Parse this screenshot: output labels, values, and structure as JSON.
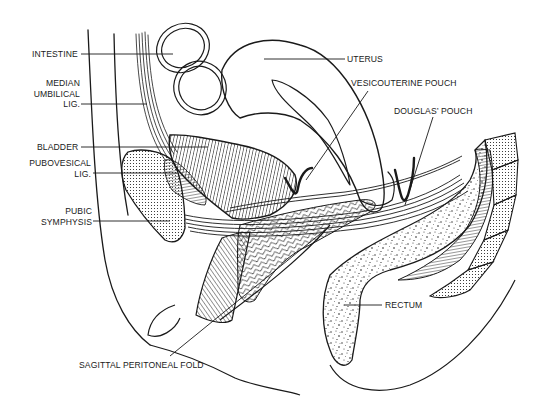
{
  "diagram": {
    "type": "anatomical-sagittal-section",
    "colors": {
      "ink": "#1a1a1a",
      "background": "#ffffff"
    },
    "labels": {
      "intestine": "INTESTINE",
      "median_umbilical_lig": "MEDIAN\nUMBILICAL\nLIG.",
      "bladder": "BLADDER",
      "pubovesical_lig": "PUBOVESICAL\nLIG.",
      "pubic_symphysis": "PUBIC\nSYMPHYSIS",
      "uterus": "UTERUS",
      "vesicouterine_pouch": "VESICOUTERINE POUCH",
      "douglas_pouch": "DOUGLAS’ POUCH",
      "rectum": "RECTUM",
      "sagittal_peritoneal_fold": "SAGITTAL PERITONEAL FOLD"
    }
  }
}
